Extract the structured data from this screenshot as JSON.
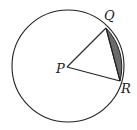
{
  "diagram": {
    "type": "circle-segment",
    "labels": {
      "center": "P",
      "point1": "Q",
      "point2": "R"
    },
    "colors": {
      "stroke": "#222222",
      "segment_fill": "#6b6b6b",
      "background": "#ffffff"
    }
  }
}
